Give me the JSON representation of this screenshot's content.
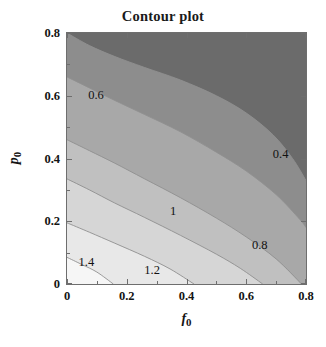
{
  "title": "Contour plot",
  "axes": {
    "x": {
      "label_var": "f",
      "label_sub": "0",
      "ticks": [
        "0",
        "0.2",
        "0.4",
        "0.6",
        "0.8"
      ],
      "range": [
        0,
        0.8
      ]
    },
    "y": {
      "label_var": "p",
      "label_sub": "0",
      "ticks": [
        "0",
        "0.2",
        "0.4",
        "0.6",
        "0.8"
      ],
      "range": [
        0,
        0.8
      ]
    }
  },
  "chart_data": {
    "type": "heatmap",
    "subtype": "filled-contour",
    "title": "Contour plot",
    "xlabel": "f_0",
    "ylabel": "p_0",
    "xlim": [
      0,
      0.8
    ],
    "ylim": [
      0,
      0.8
    ],
    "xticks": [
      0,
      0.2,
      0.4,
      0.6,
      0.8
    ],
    "yticks": [
      0,
      0.2,
      0.4,
      0.6,
      0.8
    ],
    "grid": false,
    "legend": "none",
    "colormap": "grayscale-reversed",
    "contour_levels": [
      0.4,
      0.6,
      0.8,
      1.0,
      1.2,
      1.4
    ],
    "level_step": 0.2,
    "value_range_shown": [
      0.3,
      1.5
    ],
    "band_fills": [
      {
        "label": "below 0.4",
        "upper": 0.4,
        "color": "#6b6b6b"
      },
      {
        "label": "0.4 - 0.6",
        "lower": 0.4,
        "upper": 0.6,
        "color": "#8d8d8d"
      },
      {
        "label": "0.6 - 0.8",
        "lower": 0.6,
        "upper": 0.8,
        "color": "#a8a8a8"
      },
      {
        "label": "0.8 - 1.0",
        "lower": 0.8,
        "upper": 1.0,
        "color": "#c0c0c0"
      },
      {
        "label": "1.0 - 1.2",
        "lower": 1.0,
        "upper": 1.2,
        "color": "#d6d6d6"
      },
      {
        "label": "1.2 - 1.4",
        "lower": 1.2,
        "upper": 1.4,
        "color": "#e8e8e8"
      },
      {
        "label": "above 1.4",
        "lower": 1.4,
        "color": "#f6f6f6"
      }
    ],
    "contour_line_color": "#909090",
    "contours": [
      {
        "level": 0.4,
        "label": "0.4",
        "label_pos": {
          "x": 0.715,
          "y": 0.415
        },
        "points": [
          {
            "x": 0.0,
            "y": 0.8
          },
          {
            "x": 0.075,
            "y": 0.76
          },
          {
            "x": 0.16,
            "y": 0.725
          },
          {
            "x": 0.26,
            "y": 0.69
          },
          {
            "x": 0.38,
            "y": 0.65
          },
          {
            "x": 0.5,
            "y": 0.6
          },
          {
            "x": 0.6,
            "y": 0.545
          },
          {
            "x": 0.69,
            "y": 0.475
          },
          {
            "x": 0.755,
            "y": 0.4
          },
          {
            "x": 0.8,
            "y": 0.33
          }
        ]
      },
      {
        "level": 0.6,
        "label": "0.6",
        "label_pos": {
          "x": 0.097,
          "y": 0.603
        },
        "points": [
          {
            "x": 0.0,
            "y": 0.66
          },
          {
            "x": 0.075,
            "y": 0.625
          },
          {
            "x": 0.16,
            "y": 0.585
          },
          {
            "x": 0.26,
            "y": 0.54
          },
          {
            "x": 0.38,
            "y": 0.485
          },
          {
            "x": 0.5,
            "y": 0.42
          },
          {
            "x": 0.6,
            "y": 0.36
          },
          {
            "x": 0.7,
            "y": 0.285
          },
          {
            "x": 0.78,
            "y": 0.205
          },
          {
            "x": 0.8,
            "y": 0.18
          }
        ]
      },
      {
        "level": 0.8,
        "label": "0.8",
        "label_pos": {
          "x": 0.645,
          "y": 0.123
        },
        "points": [
          {
            "x": 0.0,
            "y": 0.46
          },
          {
            "x": 0.075,
            "y": 0.425
          },
          {
            "x": 0.16,
            "y": 0.385
          },
          {
            "x": 0.26,
            "y": 0.335
          },
          {
            "x": 0.38,
            "y": 0.275
          },
          {
            "x": 0.5,
            "y": 0.21
          },
          {
            "x": 0.6,
            "y": 0.15
          },
          {
            "x": 0.7,
            "y": 0.08
          },
          {
            "x": 0.785,
            "y": 0.0
          }
        ]
      },
      {
        "level": 1.0,
        "label": "1",
        "label_pos": {
          "x": 0.355,
          "y": 0.232
        },
        "points": [
          {
            "x": 0.0,
            "y": 0.335
          },
          {
            "x": 0.075,
            "y": 0.3
          },
          {
            "x": 0.16,
            "y": 0.258
          },
          {
            "x": 0.26,
            "y": 0.212
          },
          {
            "x": 0.38,
            "y": 0.155
          },
          {
            "x": 0.5,
            "y": 0.095
          },
          {
            "x": 0.58,
            "y": 0.05
          },
          {
            "x": 0.655,
            "y": 0.0
          }
        ]
      },
      {
        "level": 1.2,
        "label": "1.2",
        "label_pos": {
          "x": 0.285,
          "y": 0.045
        },
        "points": [
          {
            "x": 0.0,
            "y": 0.195
          },
          {
            "x": 0.075,
            "y": 0.165
          },
          {
            "x": 0.16,
            "y": 0.13
          },
          {
            "x": 0.26,
            "y": 0.088
          },
          {
            "x": 0.345,
            "y": 0.048
          },
          {
            "x": 0.425,
            "y": 0.0
          }
        ]
      },
      {
        "level": 1.4,
        "label": "1.4",
        "label_pos": {
          "x": 0.065,
          "y": 0.07
        },
        "points": [
          {
            "x": 0.0,
            "y": 0.085
          },
          {
            "x": 0.05,
            "y": 0.062
          },
          {
            "x": 0.1,
            "y": 0.038
          },
          {
            "x": 0.155,
            "y": 0.0
          }
        ]
      }
    ]
  }
}
